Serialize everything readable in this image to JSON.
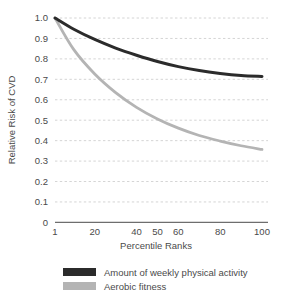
{
  "chart_data": {
    "type": "line",
    "title": "",
    "xlabel": "Percentile Ranks",
    "ylabel": "Relative Risk of CVD",
    "xlim": [
      1,
      100
    ],
    "ylim": [
      0,
      1.0
    ],
    "grid": true,
    "legend_position": "bottom-left",
    "x_ticks": [
      1,
      20,
      40,
      50,
      60,
      80,
      100
    ],
    "x_tick_labels": [
      "1",
      "20",
      "40",
      "50",
      "60",
      "80",
      "100"
    ],
    "y_ticks": [
      0,
      0.1,
      0.2,
      0.3,
      0.4,
      0.5,
      0.6,
      0.7,
      0.8,
      0.9,
      1.0
    ],
    "y_tick_labels": [
      "0",
      "0.1",
      "0.2",
      "0.3",
      "0.4",
      "0.5",
      "0.6",
      "0.7",
      "0.8",
      "0.9",
      "1.0"
    ],
    "x": [
      1,
      10,
      20,
      30,
      40,
      50,
      60,
      70,
      80,
      90,
      100
    ],
    "series": [
      {
        "name": "Amount of weekly physical activity",
        "color": "#2b2b2b",
        "values": [
          1.0,
          0.945,
          0.895,
          0.853,
          0.818,
          0.787,
          0.762,
          0.743,
          0.729,
          0.719,
          0.714
        ]
      },
      {
        "name": "Aerobic fitness",
        "color": "#b4b4b4",
        "values": [
          1.0,
          0.845,
          0.726,
          0.635,
          0.563,
          0.506,
          0.461,
          0.425,
          0.398,
          0.375,
          0.357
        ]
      }
    ]
  },
  "legend": {
    "items": [
      {
        "label": "Amount of weekly physical activity",
        "color": "#2b2b2b"
      },
      {
        "label": "Aerobic fitness",
        "color": "#b4b4b4"
      }
    ]
  },
  "colors": {
    "activity": "#2b2b2b",
    "fitness": "#b4b4b4",
    "grid": "#c9c9c9",
    "axis": "#6e6e6e",
    "text": "#4a4a4a",
    "background": "#ffffff"
  }
}
